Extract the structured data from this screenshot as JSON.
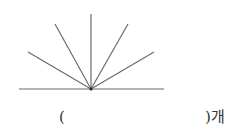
{
  "figure": {
    "line_color": "#6b6b6b",
    "vertex": {
      "x": 91,
      "y": 89
    },
    "baseline": {
      "x1": 19,
      "y1": 89,
      "x2": 164,
      "y2": 89
    },
    "rays": [
      {
        "x": 28,
        "y": 52
      },
      {
        "x": 55,
        "y": 24
      },
      {
        "x": 91,
        "y": 14
      },
      {
        "x": 128,
        "y": 24
      },
      {
        "x": 154,
        "y": 52
      }
    ]
  },
  "answer": {
    "open": "(",
    "close": ")개"
  }
}
